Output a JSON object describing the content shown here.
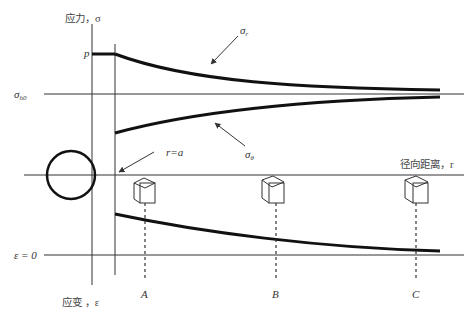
{
  "figure": {
    "type": "stress-strain distribution around circular opening",
    "axes": {
      "stress_axis_label": "应力，σ",
      "strain_axis_label": "应变 ，ε",
      "radial_axis_label": "径向距离，r"
    },
    "levels": {
      "p_label": "p",
      "sigma_h0_symbol": "σ",
      "sigma_h0_sub": "h0",
      "epsilon_zero_label": "ε = 0"
    },
    "curves": {
      "sigma_r_symbol": "σ",
      "sigma_r_sub": "r",
      "sigma_theta_symbol": "σ",
      "sigma_theta_sub": "θ"
    },
    "opening": {
      "boundary_label": "r=a"
    },
    "points": [
      {
        "label": "A"
      },
      {
        "label": "B"
      },
      {
        "label": "C"
      }
    ],
    "colors": {
      "line": "#111111",
      "thin_line": "#333333",
      "background": "#ffffff"
    }
  }
}
